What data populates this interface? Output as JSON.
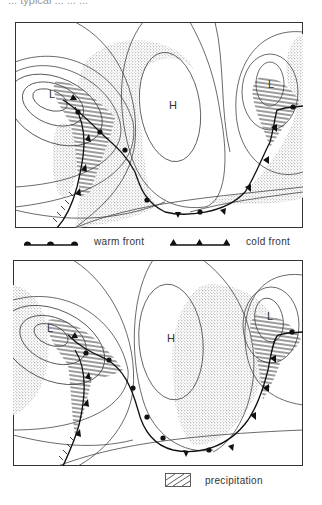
{
  "caption_fragment": "... typical ... ... ...",
  "panels": [
    {
      "id": "top",
      "pressure_labels": [
        {
          "text": "L",
          "x": 34,
          "y": 76
        },
        {
          "text": "H",
          "x": 154,
          "y": 87
        },
        {
          "text": "L",
          "x": 253,
          "y": 66
        }
      ]
    },
    {
      "id": "bottom",
      "pressure_labels": [
        {
          "text": "L",
          "x": 34,
          "y": 72
        },
        {
          "text": "H",
          "x": 154,
          "y": 82
        },
        {
          "text": "L",
          "x": 254,
          "y": 60
        }
      ]
    }
  ],
  "legend": {
    "warm_front": "warm front",
    "cold_front": "cold front",
    "precipitation": "precipitation"
  },
  "colors": {
    "ink": "#222222",
    "isobar": "#444444",
    "cloud_stipple": "#9a9a9a",
    "background": "#ffffff"
  }
}
